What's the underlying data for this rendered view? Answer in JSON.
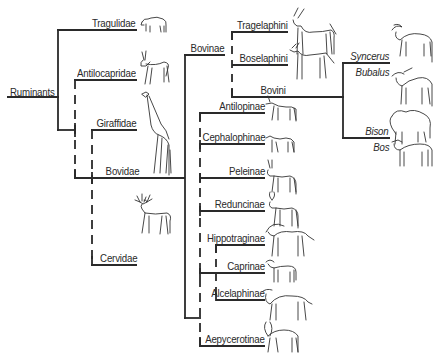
{
  "diagram": {
    "type": "phylogenetic-tree",
    "root": "Ruminants",
    "families": [
      {
        "id": "tragulidae",
        "label": "Tragulidae"
      },
      {
        "id": "antilocapridae",
        "label": "Antilocapridae"
      },
      {
        "id": "giraffidae",
        "label": "Giraffidae"
      },
      {
        "id": "bovidae",
        "label": "Bovidae"
      },
      {
        "id": "cervidae",
        "label": "Cervidae"
      }
    ],
    "bovidae_subgroups": {
      "bovinae": {
        "label": "Bovinae",
        "tribes": [
          {
            "id": "tragelaphini",
            "label": "Tragelaphini"
          },
          {
            "id": "boselaphini",
            "label": "Boselaphini"
          },
          {
            "id": "bovini",
            "label": "Bovini"
          }
        ],
        "bovini_genera": [
          {
            "id": "syncerus",
            "label": "Syncerus"
          },
          {
            "id": "bubalus",
            "label": "Bubalus"
          },
          {
            "id": "bison",
            "label": "Bison"
          },
          {
            "id": "bos",
            "label": "Bos"
          }
        ]
      },
      "other_subfamilies": [
        {
          "id": "antilopinae",
          "label": "Antilopinae"
        },
        {
          "id": "cephalophinae",
          "label": "Cephalophinae"
        },
        {
          "id": "peleinae",
          "label": "Peleinae"
        },
        {
          "id": "reduncinae",
          "label": "Reduncinae"
        },
        {
          "id": "hippotraginae",
          "label": "Hippotraginae"
        },
        {
          "id": "caprinae",
          "label": "Caprinae"
        },
        {
          "id": "alcelaphinae",
          "label": "Alcelaphinae"
        },
        {
          "id": "aepycerotinae",
          "label": "Aepycerotinae"
        }
      ]
    },
    "colors": {
      "line": "#2a2a2a",
      "background": "#ffffff"
    }
  }
}
